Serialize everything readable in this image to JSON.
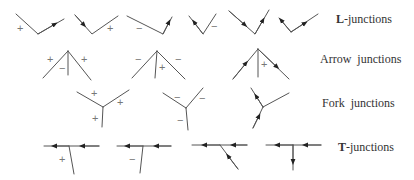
{
  "rows": [
    {
      "name": "L-junctions",
      "bold": "L",
      "rest": "-junctions",
      "y": 20
    },
    {
      "name": "Arrow junctions",
      "bold": "",
      "rest": "Arrow  junctions",
      "y": 60
    },
    {
      "name": "Fork junctions",
      "bold": "",
      "rest": "Fork  junctions",
      "y": 103
    },
    {
      "name": "T-junctions",
      "bold": "T",
      "rest": "-junctions",
      "y": 148
    }
  ],
  "signs": {
    "plus": "+",
    "minus": "−"
  },
  "colors": {
    "line": "#555555",
    "sign": "#777777",
    "text": "#333333"
  }
}
